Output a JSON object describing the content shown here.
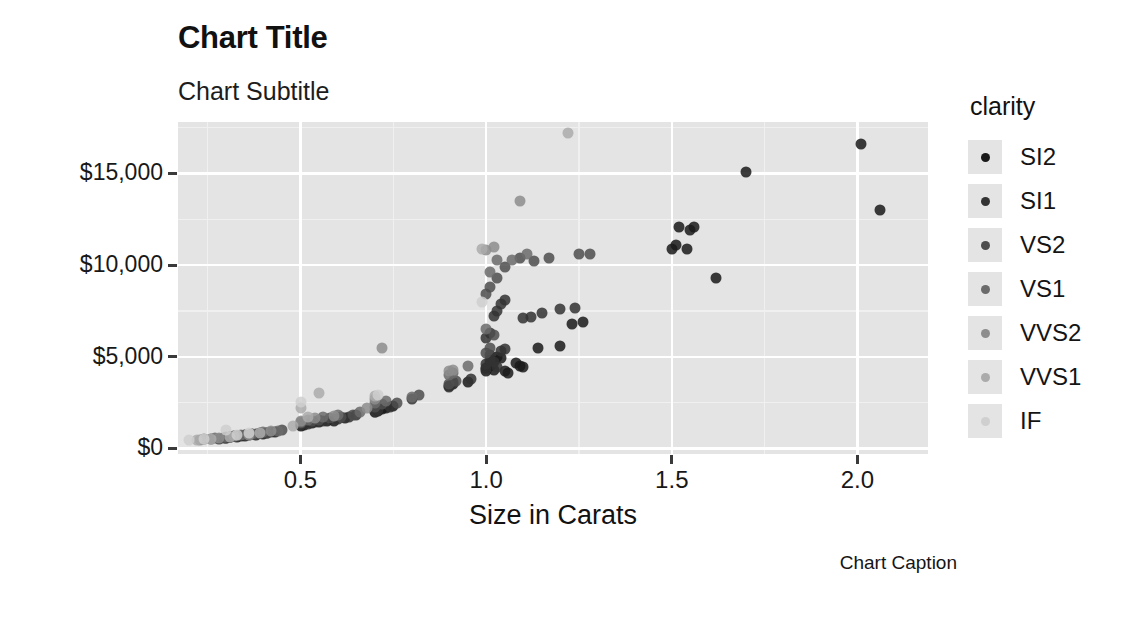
{
  "chart_data": {
    "type": "scatter",
    "title": "Chart Title",
    "subtitle": "Chart Subtitle",
    "caption": "Chart Caption",
    "xlabel": "Size in Carats",
    "ylabel": "Price ($)",
    "xlim": [
      0.17,
      2.19
    ],
    "ylim": [
      -300,
      17800
    ],
    "xticks": [
      0.5,
      1.0,
      1.5,
      2.0
    ],
    "xtick_labels": [
      "0.5",
      "1.0",
      "1.5",
      "2.0"
    ],
    "yticks": [
      0,
      5000,
      10000,
      15000
    ],
    "ytick_labels": [
      "$0",
      "$5,000",
      "$10,000",
      "$15,000"
    ],
    "grid": true,
    "grid_minor": true,
    "panel_background": "#e4e4e4",
    "grid_color": "#ffffff",
    "legend": {
      "title": "clarity",
      "position": "right",
      "entries": [
        {
          "label": "SI2",
          "color": "#1a1a1a"
        },
        {
          "label": "SI1",
          "color": "#333333"
        },
        {
          "label": "VS2",
          "color": "#4d4d4d"
        },
        {
          "label": "VS1",
          "color": "#6b6b6b"
        },
        {
          "label": "VVS2",
          "color": "#8d8d8d"
        },
        {
          "label": "VVS1",
          "color": "#ababab"
        },
        {
          "label": "IF",
          "color": "#cfcfcf"
        }
      ]
    },
    "point_size": 11,
    "point_opacity": 0.85,
    "series": [
      {
        "name": "SI2",
        "color": "#1a1a1a",
        "points": [
          [
            0.3,
            560
          ],
          [
            0.31,
            600
          ],
          [
            0.33,
            640
          ],
          [
            0.34,
            700
          ],
          [
            0.35,
            680
          ],
          [
            0.36,
            720
          ],
          [
            0.38,
            760
          ],
          [
            0.4,
            800
          ],
          [
            0.41,
            840
          ],
          [
            0.43,
            880
          ],
          [
            0.5,
            1250
          ],
          [
            0.51,
            1300
          ],
          [
            0.53,
            1380
          ],
          [
            0.55,
            1420
          ],
          [
            0.57,
            1480
          ],
          [
            0.59,
            1520
          ],
          [
            0.62,
            1680
          ],
          [
            0.7,
            1980
          ],
          [
            0.71,
            2050
          ],
          [
            0.72,
            2150
          ],
          [
            0.73,
            2200
          ],
          [
            0.75,
            2320
          ],
          [
            0.9,
            3400
          ],
          [
            0.91,
            3520
          ],
          [
            0.95,
            3650
          ],
          [
            1.0,
            4200
          ],
          [
            1.0,
            4400
          ],
          [
            1.01,
            4500
          ],
          [
            1.01,
            4650
          ],
          [
            1.02,
            4300
          ],
          [
            1.02,
            4780
          ],
          [
            1.03,
            5000
          ],
          [
            1.04,
            4950
          ],
          [
            1.05,
            4200
          ],
          [
            1.06,
            4100
          ],
          [
            1.08,
            4650
          ],
          [
            1.09,
            4520
          ],
          [
            1.1,
            4450
          ],
          [
            1.14,
            5500
          ],
          [
            1.2,
            5600
          ],
          [
            1.23,
            6800
          ],
          [
            1.26,
            6900
          ],
          [
            1.5,
            10900
          ],
          [
            1.51,
            11100
          ],
          [
            1.52,
            12100
          ],
          [
            1.54,
            10900
          ],
          [
            1.55,
            11900
          ],
          [
            1.56,
            12100
          ],
          [
            1.62,
            9300
          ],
          [
            1.7,
            15100
          ],
          [
            2.01,
            16600
          ],
          [
            2.06,
            13000
          ]
        ]
      },
      {
        "name": "SI1",
        "color": "#333333",
        "points": [
          [
            0.28,
            540
          ],
          [
            0.3,
            580
          ],
          [
            0.31,
            620
          ],
          [
            0.32,
            660
          ],
          [
            0.33,
            700
          ],
          [
            0.35,
            710
          ],
          [
            0.37,
            780
          ],
          [
            0.39,
            820
          ],
          [
            0.42,
            900
          ],
          [
            0.5,
            1300
          ],
          [
            0.52,
            1350
          ],
          [
            0.54,
            1440
          ],
          [
            0.56,
            1490
          ],
          [
            0.6,
            1600
          ],
          [
            0.63,
            1740
          ],
          [
            0.65,
            1800
          ],
          [
            0.7,
            2000
          ],
          [
            0.71,
            2100
          ],
          [
            0.74,
            2280
          ],
          [
            0.8,
            2700
          ],
          [
            0.9,
            3350
          ],
          [
            0.91,
            3600
          ],
          [
            0.96,
            3800
          ],
          [
            1.0,
            4350
          ],
          [
            1.0,
            4600
          ],
          [
            1.01,
            4850
          ],
          [
            1.01,
            5100
          ],
          [
            1.02,
            4700
          ],
          [
            1.03,
            4420
          ],
          [
            1.04,
            5300
          ],
          [
            1.05,
            5400
          ],
          [
            1.0,
            6000
          ],
          [
            1.01,
            6300
          ],
          [
            1.02,
            7200
          ],
          [
            1.03,
            7500
          ],
          [
            1.04,
            7900
          ],
          [
            1.05,
            8100
          ],
          [
            1.1,
            7100
          ],
          [
            1.12,
            7150
          ],
          [
            1.15,
            7400
          ],
          [
            1.2,
            7600
          ],
          [
            1.24,
            7650
          ]
        ]
      },
      {
        "name": "VS2",
        "color": "#4d4d4d",
        "points": [
          [
            0.26,
            520
          ],
          [
            0.29,
            570
          ],
          [
            0.31,
            630
          ],
          [
            0.33,
            680
          ],
          [
            0.35,
            740
          ],
          [
            0.38,
            800
          ],
          [
            0.41,
            870
          ],
          [
            0.45,
            1000
          ],
          [
            0.5,
            1400
          ],
          [
            0.53,
            1500
          ],
          [
            0.55,
            1560
          ],
          [
            0.58,
            1650
          ],
          [
            0.61,
            1720
          ],
          [
            0.64,
            1850
          ],
          [
            0.7,
            2250
          ],
          [
            0.72,
            2400
          ],
          [
            0.76,
            2500
          ],
          [
            0.82,
            2900
          ],
          [
            0.9,
            3500
          ],
          [
            0.92,
            3700
          ],
          [
            1.0,
            5200
          ],
          [
            1.01,
            5500
          ],
          [
            1.02,
            6200
          ],
          [
            1.0,
            8400
          ],
          [
            1.01,
            8800
          ],
          [
            1.03,
            9300
          ],
          [
            1.05,
            9900
          ],
          [
            1.09,
            10400
          ],
          [
            1.13,
            10200
          ],
          [
            1.17,
            10400
          ],
          [
            1.25,
            10600
          ],
          [
            1.28,
            10600
          ]
        ]
      },
      {
        "name": "VS1",
        "color": "#6b6b6b",
        "points": [
          [
            0.24,
            500
          ],
          [
            0.27,
            550
          ],
          [
            0.3,
            610
          ],
          [
            0.34,
            720
          ],
          [
            0.37,
            790
          ],
          [
            0.4,
            880
          ],
          [
            0.44,
            980
          ],
          [
            0.5,
            1450
          ],
          [
            0.52,
            1550
          ],
          [
            0.56,
            1700
          ],
          [
            0.6,
            1800
          ],
          [
            0.66,
            2000
          ],
          [
            0.7,
            2480
          ],
          [
            0.73,
            2600
          ],
          [
            0.8,
            2800
          ],
          [
            0.9,
            4000
          ],
          [
            0.91,
            4100
          ],
          [
            0.95,
            4500
          ],
          [
            1.0,
            6500
          ],
          [
            1.01,
            9600
          ],
          [
            1.03,
            10300
          ],
          [
            1.07,
            10300
          ],
          [
            1.11,
            10600
          ]
        ]
      },
      {
        "name": "VVS2",
        "color": "#8d8d8d",
        "points": [
          [
            0.23,
            490
          ],
          [
            0.28,
            560
          ],
          [
            0.32,
            660
          ],
          [
            0.36,
            760
          ],
          [
            0.42,
            930
          ],
          [
            0.5,
            1500
          ],
          [
            0.54,
            1650
          ],
          [
            0.59,
            1790
          ],
          [
            0.68,
            2200
          ],
          [
            0.7,
            2700
          ],
          [
            0.72,
            5500
          ],
          [
            0.9,
            4250
          ],
          [
            0.91,
            4300
          ],
          [
            1.0,
            10800
          ],
          [
            1.02,
            11000
          ],
          [
            1.09,
            13500
          ]
        ]
      },
      {
        "name": "VVS1",
        "color": "#ababab",
        "points": [
          [
            0.22,
            480
          ],
          [
            0.26,
            540
          ],
          [
            0.31,
            650
          ],
          [
            0.39,
            850
          ],
          [
            0.48,
            1250
          ],
          [
            0.5,
            2200
          ],
          [
            0.52,
            1700
          ],
          [
            0.55,
            3000
          ],
          [
            0.7,
            2850
          ],
          [
            0.99,
            10900
          ],
          [
            1.22,
            17200
          ]
        ]
      },
      {
        "name": "IF",
        "color": "#cfcfcf",
        "points": [
          [
            0.2,
            470
          ],
          [
            0.24,
            520
          ],
          [
            0.3,
            1000
          ],
          [
            0.33,
            760
          ],
          [
            0.36,
            820
          ],
          [
            0.5,
            2550
          ],
          [
            0.71,
            2900
          ],
          [
            0.99,
            8000
          ]
        ]
      }
    ]
  }
}
